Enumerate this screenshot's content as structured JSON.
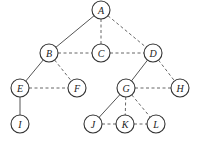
{
  "diagram": {
    "type": "tree-graph",
    "node_radius": 9,
    "nodes": [
      {
        "id": "A",
        "label": "A",
        "x": 101,
        "y": 10
      },
      {
        "id": "B",
        "label": "B",
        "x": 49,
        "y": 53
      },
      {
        "id": "C",
        "label": "C",
        "x": 101,
        "y": 53
      },
      {
        "id": "D",
        "label": "D",
        "x": 153,
        "y": 53
      },
      {
        "id": "E",
        "label": "E",
        "x": 20,
        "y": 88
      },
      {
        "id": "F",
        "label": "F",
        "x": 77,
        "y": 88
      },
      {
        "id": "G",
        "label": "G",
        "x": 126,
        "y": 88
      },
      {
        "id": "H",
        "label": "H",
        "x": 180,
        "y": 88
      },
      {
        "id": "I",
        "label": "I",
        "x": 20,
        "y": 124
      },
      {
        "id": "J",
        "label": "J",
        "x": 93,
        "y": 124
      },
      {
        "id": "K",
        "label": "K",
        "x": 125,
        "y": 124
      },
      {
        "id": "L",
        "label": "L",
        "x": 156,
        "y": 124
      }
    ],
    "edges": [
      {
        "from": "A",
        "to": "B",
        "style": "solid"
      },
      {
        "from": "A",
        "to": "C",
        "style": "dashed"
      },
      {
        "from": "A",
        "to": "D",
        "style": "dashed"
      },
      {
        "from": "B",
        "to": "C",
        "style": "dashed"
      },
      {
        "from": "C",
        "to": "D",
        "style": "dashed"
      },
      {
        "from": "B",
        "to": "E",
        "style": "solid"
      },
      {
        "from": "B",
        "to": "F",
        "style": "dashed"
      },
      {
        "from": "E",
        "to": "F",
        "style": "dashed"
      },
      {
        "from": "E",
        "to": "I",
        "style": "solid"
      },
      {
        "from": "D",
        "to": "G",
        "style": "solid"
      },
      {
        "from": "D",
        "to": "H",
        "style": "dashed"
      },
      {
        "from": "G",
        "to": "H",
        "style": "dashed"
      },
      {
        "from": "G",
        "to": "J",
        "style": "solid"
      },
      {
        "from": "G",
        "to": "K",
        "style": "dashed"
      },
      {
        "from": "G",
        "to": "L",
        "style": "dashed"
      },
      {
        "from": "J",
        "to": "K",
        "style": "dashed"
      },
      {
        "from": "K",
        "to": "L",
        "style": "dashed"
      }
    ]
  }
}
